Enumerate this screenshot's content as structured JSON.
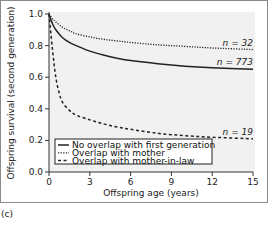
{
  "chart_data": {
    "type": "line",
    "title": "",
    "panel_label": "(c)",
    "xlabel": "Offspring age (years)",
    "ylabel": "Offspring survival (second generation)",
    "xlim": [
      0,
      15
    ],
    "ylim": [
      0,
      1.0
    ],
    "xticks": [
      0,
      3,
      6,
      9,
      12,
      15
    ],
    "yticks": [
      0.0,
      0.2,
      0.4,
      0.6,
      0.8,
      1.0
    ],
    "ytick_labels": [
      "0.0",
      "0.2",
      "0.4",
      "0.6",
      "0.8",
      "1.0"
    ],
    "grid": false,
    "legend_position": "lower left",
    "series": [
      {
        "name": "No overlap with first generation",
        "style": "solid",
        "annotation": "n = 773",
        "x": [
          0,
          0.25,
          0.5,
          1,
          1.5,
          2,
          3,
          4,
          5,
          6,
          8,
          10,
          12,
          15
        ],
        "values": [
          1.0,
          0.94,
          0.9,
          0.85,
          0.82,
          0.8,
          0.765,
          0.74,
          0.72,
          0.705,
          0.685,
          0.67,
          0.66,
          0.65
        ]
      },
      {
        "name": "Overlap with mother",
        "style": "dotted",
        "annotation": "n = 32",
        "x": [
          0,
          0.25,
          0.5,
          1,
          1.5,
          2,
          3,
          4,
          5,
          6,
          8,
          10,
          12,
          15
        ],
        "values": [
          1.0,
          0.97,
          0.95,
          0.915,
          0.895,
          0.875,
          0.855,
          0.84,
          0.83,
          0.82,
          0.805,
          0.795,
          0.785,
          0.775
        ]
      },
      {
        "name": "Overlap with mother-in-law",
        "style": "dashed",
        "annotation": "n = 19",
        "x": [
          0,
          0.25,
          0.5,
          0.75,
          1,
          1.5,
          2,
          3,
          4,
          5,
          6,
          8,
          10,
          12,
          15
        ],
        "values": [
          1.0,
          0.78,
          0.6,
          0.5,
          0.44,
          0.39,
          0.36,
          0.33,
          0.305,
          0.285,
          0.27,
          0.245,
          0.23,
          0.22,
          0.21
        ]
      }
    ]
  },
  "colors": {
    "plot_background": "#f1f1f1",
    "line": "#222222",
    "frame": "#8a8a8a"
  }
}
